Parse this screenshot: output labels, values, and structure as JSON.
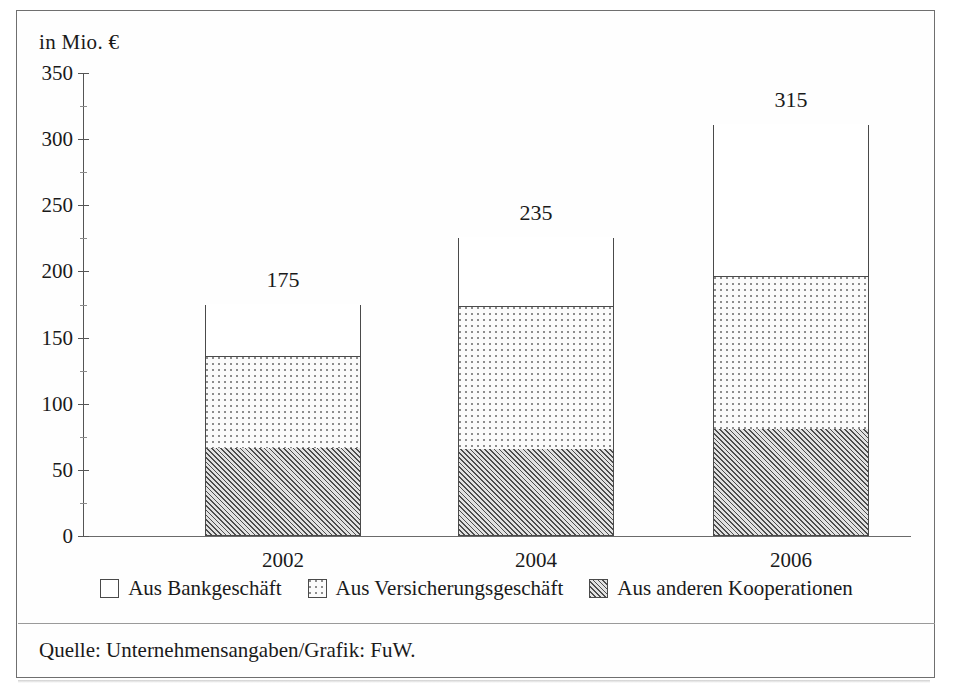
{
  "axis": {
    "unit_label": "in Mio. €",
    "y_ticks": [
      "350",
      "300",
      "250",
      "200",
      "150",
      "100",
      "50",
      "0"
    ]
  },
  "categories": [
    "2002",
    "2004",
    "2006"
  ],
  "totals": [
    "175",
    "235",
    "315"
  ],
  "legend": [
    {
      "label": "Aus Bankgeschäft",
      "swatch": "white-square-icon",
      "key": "bank"
    },
    {
      "label": "Aus Versicherungsgeschäft",
      "swatch": "dotted-square-icon",
      "key": "vers"
    },
    {
      "label": "Aus anderen Kooperationen",
      "swatch": "hatched-square-icon",
      "key": "koop"
    }
  ],
  "source": "Quelle: Unternehmensangaben/Grafik: FuW.",
  "colors": {
    "frame": "#6f6f6f",
    "axis": "#555555",
    "bar_outline": "#4a4a4a",
    "hatch_fill": "#d6d6d6",
    "dot_fill": "#fbfbfb",
    "background": "#ffffff"
  },
  "chart_data": {
    "type": "bar",
    "title": "",
    "subtitle": "",
    "xlabel": "",
    "ylabel": "in Mio. €",
    "ylim": [
      0,
      350
    ],
    "ytick_step": 50,
    "grid": false,
    "stacked": true,
    "legend_position": "bottom",
    "categories": [
      "2002",
      "2004",
      "2006"
    ],
    "series": [
      {
        "name": "Aus anderen Kooperationen",
        "values": [
          66,
          65,
          80
        ]
      },
      {
        "name": "Aus Versicherungsgeschäft",
        "values": [
          69,
          108,
          116
        ]
      },
      {
        "name": "Aus Bankgeschäft",
        "values": [
          40,
          52,
          115
        ]
      }
    ],
    "bar_totals_drawn": [
      175,
      225,
      311
    ],
    "data_labels": [
      175,
      235,
      315
    ],
    "annotations": [
      "Quelle: Unternehmensangaben/Grafik: FuW."
    ]
  }
}
